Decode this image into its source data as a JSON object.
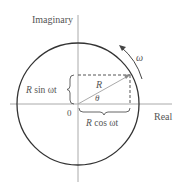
{
  "diagram": {
    "axis_labels": {
      "vertical": "Imaginary",
      "horizontal": "Real",
      "origin": "0"
    },
    "vector_label": "R",
    "angle_label": "θ",
    "rotation_label": "ω",
    "vertical_component": {
      "coef": "R",
      "text": " sin ωt"
    },
    "horizontal_component": {
      "coef": "R",
      "text": " cos ωt"
    },
    "colors": {
      "circle": "#333333",
      "axes": "#999999",
      "vector": "#aaaaaa",
      "dashes": "#555555",
      "text": "#555555"
    }
  }
}
